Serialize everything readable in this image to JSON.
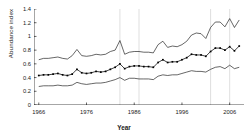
{
  "chart_data": {
    "type": "line",
    "title": "",
    "xlabel": "Year",
    "ylabel": "Abundance index",
    "xlim": [
      1965,
      2009
    ],
    "ylim": [
      0,
      1.4
    ],
    "xticks": [
      1966,
      1976,
      1986,
      1996,
      2006
    ],
    "xticklabels": [
      "1966",
      "1976",
      "1986",
      "1996",
      "2006"
    ],
    "yticks": [
      0,
      0.2,
      0.4,
      0.6,
      0.8,
      1,
      1.2,
      1.4
    ],
    "yticklabels": [
      "0",
      "0.2",
      "0.4",
      "0.6",
      "0.8",
      "1",
      "1.2",
      "1.4"
    ],
    "grid": "vertical",
    "gridlines_x": [
      1983,
      1987,
      2002,
      2006
    ],
    "legend": "none",
    "marker": "filled-square",
    "line_color": "#000000",
    "x": [
      1966,
      1967,
      1968,
      1969,
      1970,
      1971,
      1972,
      1973,
      1974,
      1975,
      1976,
      1977,
      1978,
      1979,
      1980,
      1981,
      1982,
      1983,
      1984,
      1985,
      1986,
      1987,
      1988,
      1989,
      1990,
      1991,
      1992,
      1993,
      1994,
      1995,
      1996,
      1997,
      1998,
      1999,
      2000,
      2001,
      2002,
      2003,
      2004,
      2005,
      2006,
      2007,
      2008
    ],
    "series": [
      {
        "name": "Upper confidence limit",
        "style": "thin-line",
        "values": [
          0.66,
          0.68,
          0.68,
          0.69,
          0.7,
          0.68,
          0.67,
          0.72,
          0.81,
          0.72,
          0.71,
          0.72,
          0.74,
          0.73,
          0.74,
          0.78,
          0.8,
          0.94,
          0.74,
          0.77,
          0.78,
          0.78,
          0.77,
          0.77,
          0.76,
          0.88,
          0.93,
          0.84,
          0.86,
          0.85,
          0.88,
          0.93,
          1.02,
          1.05,
          1.04,
          0.97,
          1.13,
          1.21,
          1.21,
          1.14,
          1.26,
          1.13,
          1.24
        ]
      },
      {
        "name": "Abundance index",
        "style": "line-with-markers",
        "values": [
          0.43,
          0.44,
          0.44,
          0.45,
          0.46,
          0.44,
          0.43,
          0.45,
          0.52,
          0.47,
          0.46,
          0.47,
          0.49,
          0.48,
          0.49,
          0.52,
          0.55,
          0.6,
          0.53,
          0.56,
          0.57,
          0.57,
          0.56,
          0.56,
          0.55,
          0.62,
          0.66,
          0.62,
          0.63,
          0.63,
          0.66,
          0.69,
          0.74,
          0.73,
          0.73,
          0.71,
          0.78,
          0.83,
          0.83,
          0.8,
          0.85,
          0.79,
          0.86
        ]
      },
      {
        "name": "Lower confidence limit",
        "style": "thin-line",
        "values": [
          0.27,
          0.28,
          0.28,
          0.28,
          0.29,
          0.28,
          0.28,
          0.29,
          0.33,
          0.31,
          0.3,
          0.31,
          0.32,
          0.32,
          0.33,
          0.35,
          0.37,
          0.4,
          0.36,
          0.39,
          0.39,
          0.38,
          0.38,
          0.38,
          0.37,
          0.42,
          0.44,
          0.43,
          0.44,
          0.44,
          0.46,
          0.48,
          0.5,
          0.49,
          0.49,
          0.48,
          0.52,
          0.55,
          0.56,
          0.53,
          0.58,
          0.53,
          0.55
        ]
      }
    ]
  }
}
